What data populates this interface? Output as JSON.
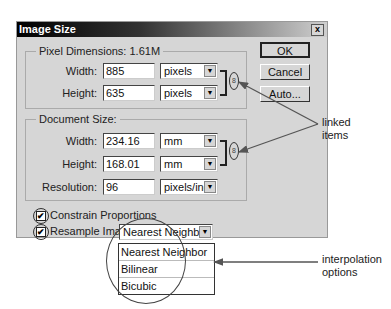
{
  "dialog": {
    "title": "Image Size",
    "close_label": "x",
    "buttons": {
      "ok": "OK",
      "cancel": "Cancel",
      "auto": "Auto..."
    }
  },
  "pixel_dimensions": {
    "legend": "Pixel Dimensions:  1.61M",
    "width_label": "Width:",
    "width_value": "885",
    "width_unit": "pixels",
    "height_label": "Height:",
    "height_value": "635",
    "height_unit": "pixels"
  },
  "document_size": {
    "legend": "Document Size:",
    "width_label": "Width:",
    "width_value": "234.16",
    "width_unit": "mm",
    "height_label": "Height:",
    "height_value": "168.01",
    "height_unit": "mm",
    "resolution_label": "Resolution:",
    "resolution_value": "96",
    "resolution_unit": "pixels/inch"
  },
  "options": {
    "constrain_label": "Constrain Proportions",
    "constrain_checked": true,
    "resample_label": "Resample Image:",
    "resample_checked": true,
    "resample_value": "Nearest Neighbor",
    "resample_options": [
      "Nearest Neighbor",
      "Bilinear",
      "Bicubic"
    ],
    "check_glyph": "✔"
  },
  "icons": {
    "dropdown_arrow": "▼",
    "link": "8"
  },
  "annotations": {
    "linked_items": "linked\nitems",
    "linked_line1": "linked",
    "linked_line2": "items",
    "interp_line1": "interpolation",
    "interp_line2": "options"
  }
}
